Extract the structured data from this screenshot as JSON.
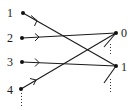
{
  "diagram": {
    "type": "bipartite-directed-graph",
    "left_nodes": [
      {
        "id": "L1",
        "label": "1",
        "x": 23,
        "y": 13
      },
      {
        "id": "L2",
        "label": "2",
        "x": 22,
        "y": 38
      },
      {
        "id": "L3",
        "label": "3",
        "x": 22,
        "y": 62
      },
      {
        "id": "L4",
        "label": "4",
        "x": 21,
        "y": 89
      }
    ],
    "right_nodes": [
      {
        "id": "R0",
        "label": "0",
        "x": 116,
        "y": 33
      },
      {
        "id": "R1",
        "label": "1",
        "x": 116,
        "y": 66
      }
    ],
    "edges": [
      {
        "from": "L1",
        "to": "R1"
      },
      {
        "from": "L2",
        "to": "R0"
      },
      {
        "from": "L3",
        "to": "R1"
      },
      {
        "from": "L4",
        "to": "R0"
      }
    ],
    "continuation_marks": [
      {
        "at": "L4",
        "style": "vertical-dots"
      },
      {
        "at": "R0",
        "style": "incoming-stub-and-dots"
      },
      {
        "at": "R1",
        "style": "incoming-stub-and-dots"
      }
    ],
    "colors": {
      "ink": "#1a1a1a",
      "background": "#ffffff"
    }
  }
}
